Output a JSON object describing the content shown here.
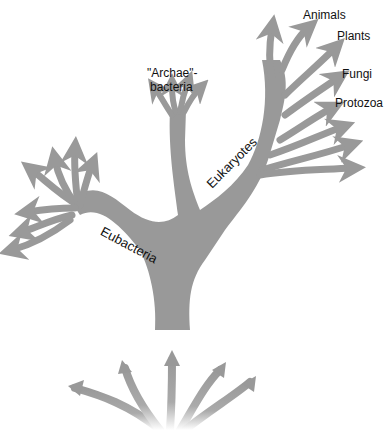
{
  "diagram": {
    "type": "phylogenetic-tree",
    "fill_color": "#999999",
    "labels": {
      "animals": "Animals",
      "plants": "Plants",
      "fungi": "Fungi",
      "protozoa": "Protozoa",
      "archae_line1": "\"Archae\"-",
      "archae_line2": "bacteria",
      "eukaryotes": "Eukaryotes",
      "eubacteria": "Eubacteria"
    }
  }
}
